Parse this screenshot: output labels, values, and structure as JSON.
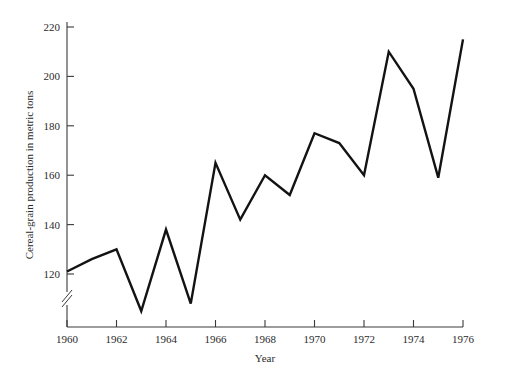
{
  "chart_data": {
    "type": "line",
    "title": "",
    "xlabel": "Year",
    "ylabel": "Cereal-grain production in metric tons",
    "x": [
      1960,
      1961,
      1962,
      1963,
      1964,
      1965,
      1966,
      1967,
      1968,
      1969,
      1970,
      1971,
      1972,
      1973,
      1974,
      1975,
      1976
    ],
    "values": [
      121,
      126,
      130,
      105,
      138,
      108,
      165,
      142,
      160,
      152,
      177,
      173,
      160,
      210,
      195,
      159,
      215
    ],
    "series": [
      {
        "name": "Cereal-grain production",
        "values": [
          121,
          126,
          130,
          105,
          138,
          108,
          165,
          142,
          160,
          152,
          177,
          173,
          160,
          210,
          195,
          159,
          215
        ]
      }
    ],
    "xlim": [
      1960,
      1976
    ],
    "ylim": [
      100,
      220
    ],
    "xticks": [
      1960,
      1962,
      1964,
      1966,
      1968,
      1970,
      1972,
      1974,
      1976
    ],
    "xtick_labels": [
      "1960",
      "1962",
      "1964",
      "1966",
      "1968",
      "1970",
      "1972",
      "1974",
      "1976"
    ],
    "yticks": [
      120,
      140,
      160,
      180,
      200,
      220
    ],
    "ytick_labels": [
      "120",
      "140",
      "160",
      "180",
      "200",
      "220"
    ],
    "grid": false,
    "legend": false,
    "axis_break": {
      "axis": "y",
      "symbol": "double-slash",
      "below_value": 120
    },
    "line_color": "#131313"
  },
  "axes": {
    "y_title": "Cereal-grain production in metric tons",
    "x_title": "Year"
  },
  "y_ticks": [
    {
      "label": "220"
    },
    {
      "label": "200"
    },
    {
      "label": "180"
    },
    {
      "label": "160"
    },
    {
      "label": "140"
    },
    {
      "label": "120"
    }
  ],
  "x_ticks": [
    {
      "label": "1960"
    },
    {
      "label": "1962"
    },
    {
      "label": "1964"
    },
    {
      "label": "1966"
    },
    {
      "label": "1968"
    },
    {
      "label": "1970"
    },
    {
      "label": "1972"
    },
    {
      "label": "1974"
    },
    {
      "label": "1976"
    }
  ]
}
